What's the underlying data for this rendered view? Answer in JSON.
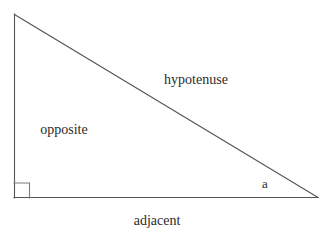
{
  "diagram": {
    "kind": "right-triangle",
    "canvas": {
      "width": 335,
      "height": 245,
      "background_color": "#ffffff"
    },
    "style": {
      "stroke_color": "#555555",
      "stroke_width": 1,
      "text_color": "#2b2b2b",
      "font_size_px": 14
    },
    "vertices": {
      "apex": {
        "x": 14,
        "y": 14
      },
      "right_angle": {
        "x": 14,
        "y": 198
      },
      "angle_a": {
        "x": 318,
        "y": 198
      }
    },
    "sides": [
      {
        "name": "opposite",
        "label": "opposite",
        "from": "apex",
        "to": "right_angle",
        "orientation": "vertical"
      },
      {
        "name": "adjacent",
        "label": "adjacent",
        "from": "right_angle",
        "to": "angle_a",
        "orientation": "horizontal"
      },
      {
        "name": "hypotenuse",
        "label": "hypotenuse",
        "from": "apex",
        "to": "angle_a",
        "orientation": "diagonal"
      }
    ],
    "angles": [
      {
        "name": "right-angle-marker",
        "label": "",
        "marker": "square",
        "at": "right_angle",
        "size_px": 15,
        "measure_degrees": 90
      },
      {
        "name": "angle-a",
        "label": "a",
        "marker": "none",
        "at": "angle_a"
      }
    ],
    "labels": {
      "hypotenuse": "hypotenuse",
      "opposite": "opposite",
      "adjacent": "adjacent",
      "angle_a": "a"
    }
  }
}
